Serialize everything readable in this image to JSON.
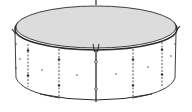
{
  "illustration": {
    "subject": "round above-ground pool with cover",
    "colors": {
      "background": "#ffffff",
      "cover_fill": "#dcdcdc",
      "line": "#2a2a2a",
      "wall_fill": "#ffffff"
    },
    "straps": [
      {
        "x": 28,
        "style": "dashed"
      },
      {
        "x": 59,
        "style": "dashed"
      },
      {
        "x": 96,
        "style": "solid"
      },
      {
        "x": 133,
        "style": "dashed"
      },
      {
        "x": 162,
        "style": "dashed"
      }
    ],
    "dots": [
      {
        "x": 20,
        "y": 59
      },
      {
        "x": 42,
        "y": 70
      },
      {
        "x": 77,
        "y": 75
      },
      {
        "x": 116,
        "y": 74
      },
      {
        "x": 148,
        "y": 67
      },
      {
        "x": 171,
        "y": 56
      }
    ]
  }
}
